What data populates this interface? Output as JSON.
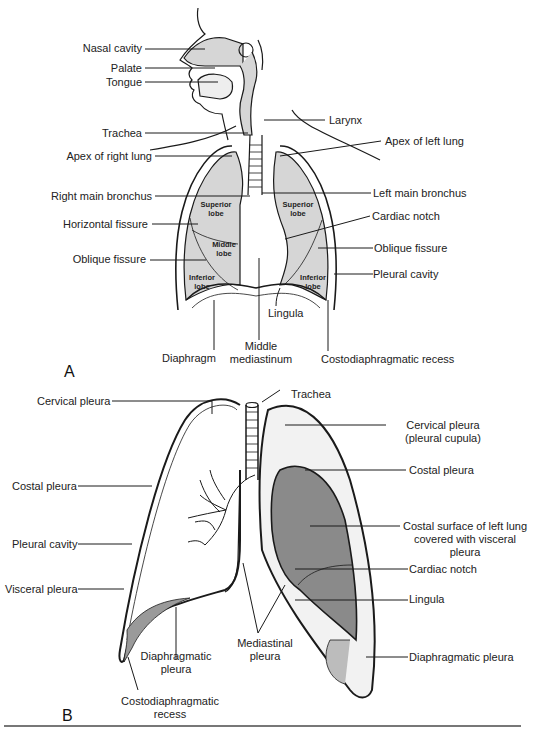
{
  "figure": {
    "panel_a": {
      "letter": "A",
      "labels_left": {
        "nasal_cavity": "Nasal cavity",
        "palate": "Palate",
        "tongue": "Tongue",
        "trachea": "Trachea",
        "apex_right_lung": "Apex of right lung",
        "right_main_bronchus": "Right main bronchus",
        "horizontal_fissure": "Horizontal fissure",
        "oblique_fissure": "Oblique fissure"
      },
      "labels_right": {
        "larynx": "Larynx",
        "apex_left_lung": "Apex of left lung",
        "left_main_bronchus": "Left main bronchus",
        "cardiac_notch": "Cardiac notch",
        "oblique_fissure": "Oblique fissure",
        "pleural_cavity": "Pleural cavity"
      },
      "labels_bottom": {
        "lingula": "Lingula",
        "diaphragm": "Diaphragm",
        "middle_mediastinum_1": "Middle",
        "middle_mediastinum_2": "mediastinum",
        "costodiaphragmatic_recess": "Costodiaphragmatic recess"
      },
      "lobes": {
        "right_superior_1": "Superior",
        "right_superior_2": "lobe",
        "right_middle_1": "Middle",
        "right_middle_2": "lobe",
        "right_inferior_1": "Inferior",
        "right_inferior_2": "lobe",
        "left_superior_1": "Superior",
        "left_superior_2": "lobe",
        "left_inferior_1": "Inferior",
        "left_inferior_2": "lobe"
      }
    },
    "panel_b": {
      "letter": "B",
      "labels_left": {
        "cervical_pleura": "Cervical pleura",
        "costal_pleura": "Costal pleura",
        "pleural_cavity": "Pleural cavity",
        "visceral_pleura": "Visceral pleura"
      },
      "labels_right": {
        "trachea": "Trachea",
        "cervical_pleura_1": "Cervical pleura",
        "cervical_pleura_2": "(pleural cupula)",
        "costal_pleura": "Costal pleura",
        "costal_surface_1": "Costal surface of left lung",
        "costal_surface_2": "covered with visceral",
        "costal_surface_3": "pleura",
        "cardiac_notch": "Cardiac notch",
        "lingula": "Lingula",
        "diaphragmatic_pleura": "Diaphragmatic pleura"
      },
      "labels_bottom": {
        "diaphragmatic_pleura_1": "Diaphragmatic",
        "diaphragmatic_pleura_2": "pleura",
        "mediastinal_pleura_1": "Mediastinal",
        "mediastinal_pleura_2": "pleura",
        "costodiaphragmatic_1": "Costodiaphragmatic",
        "costodiaphragmatic_2": "recess"
      }
    },
    "colors": {
      "lung_fill": "#d6d6d6",
      "lung_surface_dark": "#8a8a8a",
      "line": "#1a1a1a"
    }
  }
}
